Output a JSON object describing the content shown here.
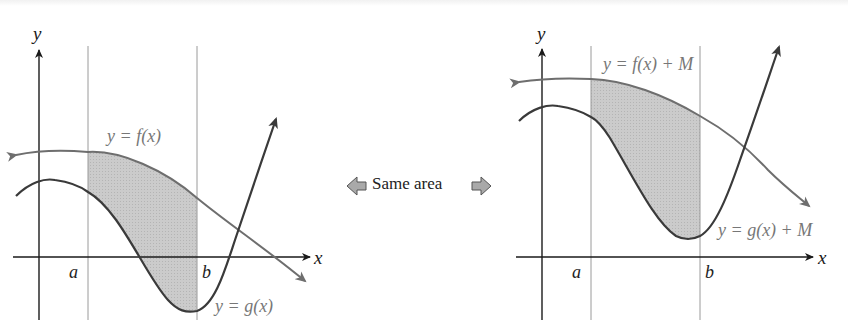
{
  "figure": {
    "left_panel": {
      "y_axis_label": "y",
      "x_axis_label": "x",
      "a_label": "a",
      "b_label": "b",
      "f_label": "y = f(x)",
      "g_label": "y = g(x)"
    },
    "right_panel": {
      "y_axis_label": "y",
      "x_axis_label": "x",
      "a_label": "a",
      "b_label": "b",
      "f_label": "y = f(x) + M",
      "g_label": "y = g(x) + M"
    },
    "center": {
      "label": "Same area",
      "left_arrow_icon": "left-arrow-icon",
      "right_arrow_icon": "right-arrow-icon"
    },
    "colors": {
      "axis": "#1a1a1a",
      "curve_f": "#6e6e6e",
      "curve_g": "#3a3a3a",
      "shade": "#c8c8c8",
      "guide_line": "#9a9a9a",
      "arrow_fill": "#a9a9a9"
    }
  }
}
